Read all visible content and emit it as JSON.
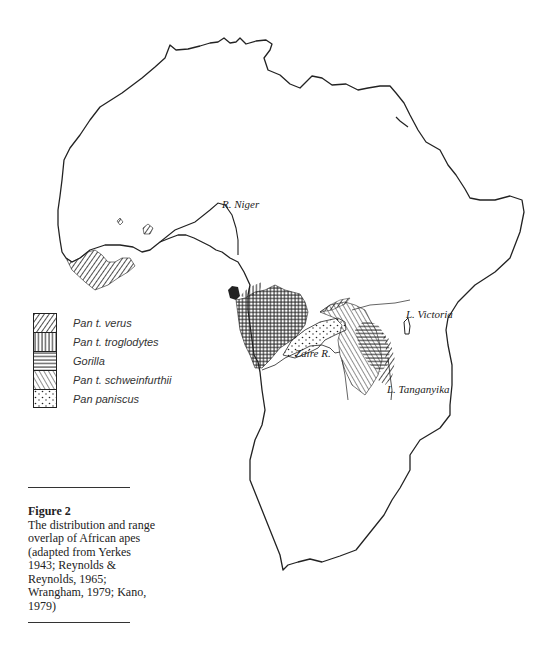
{
  "figure": {
    "title": "Figure 2",
    "caption": "The distribution  and range overlap of African apes (adapted from Yerkes 1943; Reynolds & Reynolds, 1965; Wrangham, 1979; Kano, 1979)"
  },
  "map": {
    "labels": {
      "river_niger": "R. Niger",
      "river_zaire": "Zaire R.",
      "lake_victoria": "L. Victoria",
      "lake_tanganyika": "L. Tanganyika"
    }
  },
  "legend": {
    "items": [
      {
        "label": "Pan t. verus",
        "pattern": "diagonal-hatch-right"
      },
      {
        "label": "Pan t. troglodytes",
        "pattern": "vertical-hatch"
      },
      {
        "label": "Gorilla",
        "pattern": "horizontal-hatch"
      },
      {
        "label": "Pan t. schweinfurthii",
        "pattern": "diagonal-hatch-left"
      },
      {
        "label": "Pan paniscus",
        "pattern": "stipple-dots"
      }
    ]
  },
  "colors": {
    "ink": "#222222",
    "background": "#ffffff"
  }
}
